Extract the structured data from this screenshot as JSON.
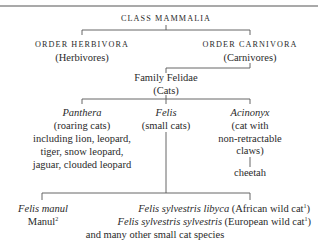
{
  "title": "CLASS MAMMALIA",
  "orders": [
    {
      "name": "ORDER HERBIVORA",
      "common": "(Herbivores)"
    },
    {
      "name": "ORDER CARNIVORA",
      "common": "(Carnivores)"
    }
  ],
  "family": {
    "name": "Family Felidae",
    "common": "(Cats)"
  },
  "genera": [
    {
      "name": "Panthera",
      "lines": [
        "(roaring cats)",
        "including lion, leopard,",
        "tiger, snow leopard,",
        "jaguar, clouded leopard"
      ]
    },
    {
      "name": "Felis",
      "lines": [
        "(small cats)"
      ]
    },
    {
      "name": "Acinonyx",
      "lines": [
        "(cat with",
        "non-retractable",
        "claws)"
      ],
      "species": "cheetah"
    }
  ],
  "felis_species": {
    "manul": {
      "latin": "Felis manul",
      "common": "Manul",
      "note": "2"
    },
    "libyca": {
      "latin": "Felis sylvestris libyca",
      "common": "(African wild cat",
      "note": "1",
      "close": ")"
    },
    "sylvestris": {
      "latin": "Felis sylvestris sylvestris",
      "common": "(European wild cat",
      "note": "1",
      "close": ")"
    },
    "others": "and many other small cat species"
  },
  "colors": {
    "line": "#555555",
    "text": "#2a2a2a"
  }
}
